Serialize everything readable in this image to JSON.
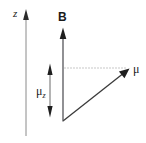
{
  "figure": {
    "type": "vector-diagram",
    "background_color": "#ffffff",
    "line_color": "#333333",
    "dotted_color": "#808080",
    "axis_color": "#808080",
    "labels": {
      "z_axis": "z",
      "b_field": "B",
      "magnetic_moment": "μ",
      "moment_z_component_symbol": "μ",
      "moment_z_component_subscript": "z"
    },
    "elements": [
      {
        "name": "z-axis",
        "kind": "arrow",
        "from": [
          26,
          135
        ],
        "to": [
          26,
          10
        ],
        "label": "z"
      },
      {
        "name": "b-field-axis",
        "kind": "arrow",
        "from": [
          63,
          121
        ],
        "to": [
          63,
          28
        ],
        "label": "B"
      },
      {
        "name": "mu-vector",
        "kind": "arrow",
        "from": [
          63,
          121
        ],
        "to": [
          129,
          69
        ],
        "label": "μ"
      },
      {
        "name": "projection-dotted-line",
        "kind": "dotted-line",
        "from": [
          64,
          68
        ],
        "to": [
          127,
          68
        ]
      },
      {
        "name": "mu-z-double-arrow",
        "kind": "double-arrow",
        "from": [
          50,
          64
        ],
        "to": [
          50,
          117
        ],
        "label": "μz"
      }
    ]
  }
}
